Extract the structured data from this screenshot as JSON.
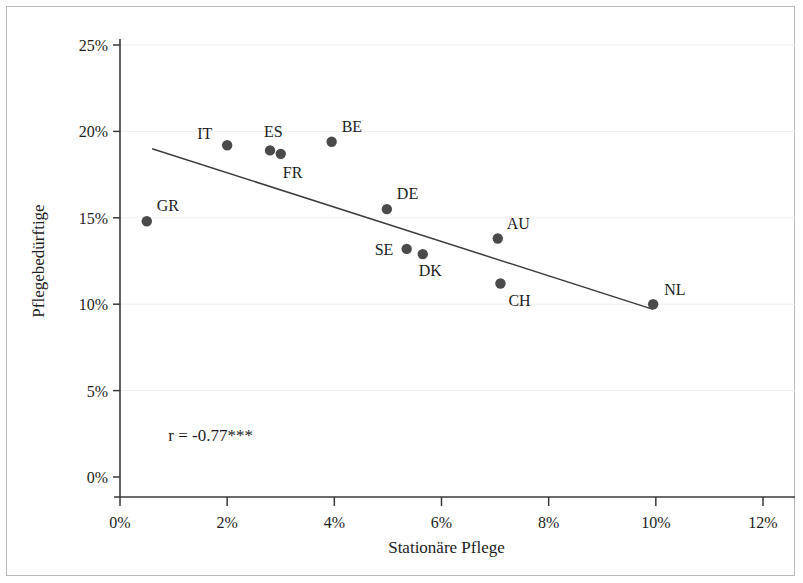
{
  "chart_data": {
    "type": "scatter",
    "title": "",
    "xlabel": "Stationäre Pflege",
    "ylabel": "Pflegebedürftige",
    "xlim": [
      0,
      12
    ],
    "ylim": [
      0,
      25
    ],
    "xticks": [
      "0%",
      "2%",
      "4%",
      "6%",
      "8%",
      "10%",
      "12%"
    ],
    "xtick_values": [
      0,
      2,
      4,
      6,
      8,
      10,
      12
    ],
    "yticks": [
      "0%",
      "5%",
      "10%",
      "15%",
      "20%",
      "25%"
    ],
    "ytick_values": [
      0,
      5,
      10,
      15,
      20,
      25
    ],
    "grid": "horizontal-faint",
    "legend": "none",
    "annotations": [
      {
        "name": "correlation",
        "text": "r = -0.77***",
        "x": 0.9,
        "y": 2.1
      }
    ],
    "points": [
      {
        "label": "GR",
        "x": 0.5,
        "y": 14.8,
        "label_dx": 10,
        "label_dy": -10
      },
      {
        "label": "IT",
        "x": 2.0,
        "y": 19.2,
        "label_dx": -30,
        "label_dy": -6
      },
      {
        "label": "ES",
        "x": 2.8,
        "y": 18.9,
        "label_dx": -6,
        "label_dy": -13
      },
      {
        "label": "FR",
        "x": 3.0,
        "y": 18.7,
        "label_dx": 2,
        "label_dy": 24
      },
      {
        "label": "BE",
        "x": 3.95,
        "y": 19.4,
        "label_dx": 10,
        "label_dy": -10
      },
      {
        "label": "DE",
        "x": 4.98,
        "y": 15.5,
        "label_dx": 10,
        "label_dy": -10
      },
      {
        "label": "SE",
        "x": 5.35,
        "y": 13.2,
        "label_dx": -32,
        "label_dy": 6
      },
      {
        "label": "DK",
        "x": 5.65,
        "y": 12.9,
        "label_dx": -4,
        "label_dy": 22
      },
      {
        "label": "AU",
        "x": 7.05,
        "y": 13.8,
        "label_dx": 9,
        "label_dy": -10
      },
      {
        "label": "CH",
        "x": 7.1,
        "y": 11.2,
        "label_dx": 8,
        "label_dy": 23
      },
      {
        "label": "NL",
        "x": 9.95,
        "y": 10.0,
        "label_dx": 11,
        "label_dy": -9
      }
    ],
    "fit_line": {
      "x0": 0.6,
      "y0": 19.0,
      "x1": 9.95,
      "y1": 9.7
    },
    "colors": {
      "point": "#4a4a4a",
      "line": "#3d3d3d",
      "axis": "#3a3a3a",
      "grid": "#f0eef0",
      "text": "#1d1d1d",
      "background": "#ffffff",
      "frame": "#b9b9b9"
    }
  }
}
